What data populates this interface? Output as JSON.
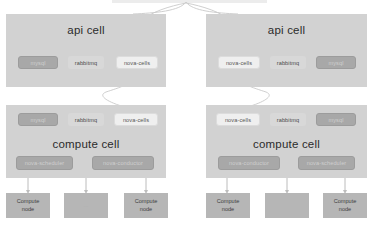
{
  "diagram": {
    "colors": {
      "cell_panel": "#d2d2d2",
      "chip_light": "#efefef",
      "chip_dark": "#a8a8a8",
      "node": "#b6b6b6",
      "connector": "#c9c9c9",
      "background": "#ffffff"
    },
    "top_parent": {
      "label": ""
    },
    "cells": [
      {
        "id": "api-cell-left",
        "title": "api cell",
        "services": [
          {
            "name": "mysql",
            "style": "dark"
          },
          {
            "name": "rabbitmq",
            "style": "plain"
          },
          {
            "name": "nova-cells",
            "style": "light"
          }
        ]
      },
      {
        "id": "api-cell-right",
        "title": "api cell",
        "services": [
          {
            "name": "nova-cells",
            "style": "light"
          },
          {
            "name": "rabbitmq",
            "style": "plain"
          },
          {
            "name": "mysql",
            "style": "dark"
          }
        ]
      },
      {
        "id": "compute-cell-left",
        "title": "compute cell",
        "services": [
          {
            "name": "mysql",
            "style": "dark"
          },
          {
            "name": "rabbitmq",
            "style": "plain"
          },
          {
            "name": "nova-cells",
            "style": "light"
          }
        ],
        "workers": [
          {
            "name": "nova-scheduler",
            "style": "dark"
          },
          {
            "name": "nova-conductor",
            "style": "dark"
          }
        ]
      },
      {
        "id": "compute-cell-right",
        "title": "compute cell",
        "services": [
          {
            "name": "nova-cells",
            "style": "light"
          },
          {
            "name": "rabbitmq",
            "style": "plain"
          },
          {
            "name": "mysql",
            "style": "dark"
          }
        ],
        "workers": [
          {
            "name": "nova-conductor",
            "style": "dark"
          },
          {
            "name": "nova-scheduler",
            "style": "dark"
          }
        ]
      }
    ],
    "compute_nodes_left": [
      {
        "line1": "Compute",
        "line2": "node"
      },
      {
        "line1": "...",
        "line2": ""
      },
      {
        "line1": "Compute",
        "line2": "node"
      }
    ],
    "compute_nodes_right": [
      {
        "line1": "Compute",
        "line2": "node"
      },
      {
        "line1": "",
        "line2": ""
      },
      {
        "line1": "Compute",
        "line2": "node"
      }
    ]
  }
}
